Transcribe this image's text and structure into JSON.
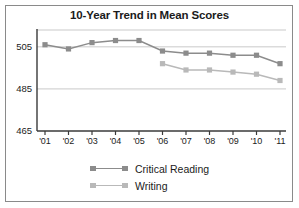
{
  "chart_data": {
    "type": "line",
    "title": "10-Year Trend in Mean Scores",
    "xlabel": "",
    "ylabel": "",
    "categories": [
      "'01",
      "'02",
      "'03",
      "'04",
      "'05",
      "'06",
      "'07",
      "'08",
      "'09",
      "'10",
      "'11"
    ],
    "yticks": [
      465,
      485,
      505
    ],
    "ylim": [
      465,
      513
    ],
    "grid": true,
    "legend_position": "bottom-center",
    "series": [
      {
        "name": "Critical Reading",
        "color": "#8c8c8c",
        "values": [
          506,
          504,
          507,
          508,
          508,
          503,
          502,
          502,
          501,
          501,
          497
        ]
      },
      {
        "name": "Writing",
        "color": "#b9b9b9",
        "values": [
          null,
          null,
          null,
          null,
          null,
          497,
          494,
          494,
          493,
          492,
          489
        ]
      }
    ]
  },
  "style": {
    "frame_color": "#8a8a8a",
    "grid_color": "#c9c9c9",
    "axis_color": "#3a3a3a",
    "text_color": "#1b1b1b",
    "background": "#ffffff"
  }
}
